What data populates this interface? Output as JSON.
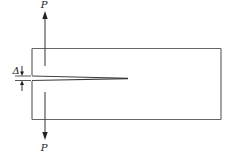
{
  "diagram": {
    "type": "double-cantilever-beam",
    "labels": {
      "force_top": "P",
      "force_bottom": "P",
      "opening": "Δ"
    },
    "colors": {
      "stroke": "#555555",
      "text": "#222222",
      "background": "#ffffff"
    }
  }
}
